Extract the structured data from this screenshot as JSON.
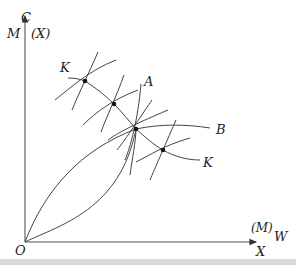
{
  "diagram": {
    "type": "edgeworth-box-contract-curve",
    "labels": {
      "y_axis_top": "C",
      "y_axis_left": "M",
      "y_axis_right": "(X)",
      "x_axis_top": "(M)",
      "x_axis_right": "W",
      "x_axis_bottom": "X",
      "origin": "O",
      "curve_a": "A",
      "curve_b": "B",
      "contract_start": "K",
      "contract_end": "K"
    },
    "points": [
      {
        "name": "tangency-1",
        "x": 85,
        "y": 81
      },
      {
        "name": "tangency-2",
        "x": 114,
        "y": 104
      },
      {
        "name": "tangency-3",
        "x": 136,
        "y": 129
      },
      {
        "name": "tangency-4",
        "x": 163,
        "y": 150
      }
    ]
  }
}
